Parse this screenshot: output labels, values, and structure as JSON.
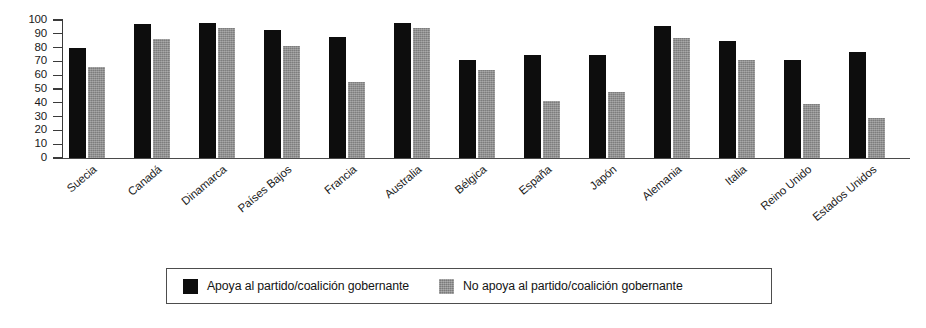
{
  "chart_data": {
    "type": "bar",
    "title": "",
    "subtitle": "",
    "xlabel": "",
    "ylabel": "",
    "ylim": [
      0,
      100
    ],
    "yticks": [
      0,
      10,
      20,
      30,
      40,
      50,
      60,
      70,
      80,
      90,
      100
    ],
    "grid": false,
    "legend_position": "bottom",
    "categories": [
      "Suecia",
      "Canadá",
      "Dinamarca",
      "Países Bajos",
      "Francia",
      "Australia",
      "Bélgica",
      "España",
      "Japón",
      "Alemania",
      "Italia",
      "Reino Unido",
      "Estados Unidos"
    ],
    "series": [
      {
        "name": "Apoya al partido/coalición gobernante",
        "color": "#0d0d0d",
        "values": [
          80,
          97,
          98,
          93,
          88,
          98,
          71,
          75,
          75,
          96,
          85,
          71,
          77
        ]
      },
      {
        "name": "No apoya al partido/coalición gobernante",
        "color": "#8f8f8f",
        "values": [
          66,
          86,
          94,
          81,
          55,
          94,
          64,
          41,
          48,
          87,
          71,
          39,
          29
        ]
      }
    ]
  },
  "legend": {
    "items": [
      {
        "label": "Apoya al partido/coalición gobernante",
        "swatch": "black"
      },
      {
        "label": "No apoya al partido/coalición gobernante",
        "swatch": "gray"
      }
    ]
  }
}
